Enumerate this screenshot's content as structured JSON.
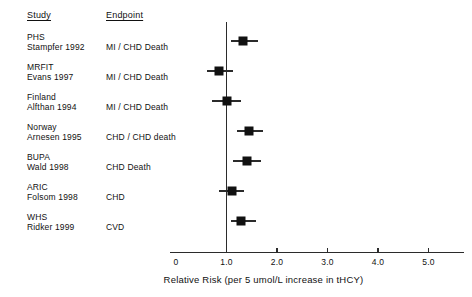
{
  "figure": {
    "headers": {
      "study": "Study",
      "endpoint": "Endpoint"
    },
    "x_axis_title": "Relative Risk (per 5 umol/L increase in tHCY)"
  },
  "chart_data": {
    "type": "forest",
    "title": "",
    "xlabel": "Relative Risk (per 5 umol/L increase in tHCY)",
    "ylabel": "",
    "xlim": [
      0,
      5.8
    ],
    "xticks": [
      0,
      1.0,
      2.0,
      3.0,
      4.0,
      5.0
    ],
    "xtick_labels": [
      "0",
      "1.0",
      "2.0",
      "3.0",
      "4.0",
      "5.0"
    ],
    "reference_line": 1.0,
    "grid": false,
    "legend": "none",
    "marker_color": "#111111",
    "axis_color": "#2b2b2b",
    "rows": [
      {
        "study": "PHS",
        "author": "Stampfer 1992",
        "endpoint": "MI / CHD Death",
        "rr": 1.32,
        "ci_low": 1.08,
        "ci_high": 1.62
      },
      {
        "study": "MRFIT",
        "author": "Evans 1997",
        "endpoint": "MI / CHD Death",
        "rr": 0.85,
        "ci_low": 0.62,
        "ci_high": 1.12
      },
      {
        "study": "Finland",
        "author": "Alfthan 1994",
        "endpoint": "MI / CHD Death",
        "rr": 1.0,
        "ci_low": 0.72,
        "ci_high": 1.28
      },
      {
        "study": "Norway",
        "author": "Arnesen 1995",
        "endpoint": "CHD / CHD death",
        "rr": 1.45,
        "ci_low": 1.2,
        "ci_high": 1.72
      },
      {
        "study": "BUPA",
        "author": "Wald 1998",
        "endpoint": "CHD Death",
        "rr": 1.4,
        "ci_low": 1.12,
        "ci_high": 1.68
      },
      {
        "study": "ARIC",
        "author": "Folsom 1998",
        "endpoint": "CHD",
        "rr": 1.1,
        "ci_low": 0.86,
        "ci_high": 1.34
      },
      {
        "study": "WHS",
        "author": "Ridker 1999",
        "endpoint": "CVD",
        "rr": 1.28,
        "ci_low": 1.08,
        "ci_high": 1.58
      }
    ]
  }
}
